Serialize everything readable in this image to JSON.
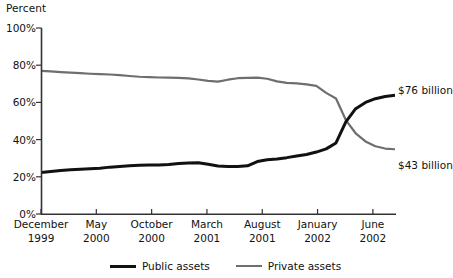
{
  "chart_data": {
    "type": "line",
    "title": "",
    "ylabel": "Percent",
    "xlabel": "",
    "ylim": [
      0,
      100
    ],
    "yticks": [
      0,
      20,
      40,
      60,
      80,
      100
    ],
    "ytick_labels": [
      "0%",
      "20%",
      "40%",
      "60%",
      "80%",
      "100%"
    ],
    "grid": false,
    "legend_position": "bottom-center",
    "x_tick_labels": [
      {
        "month": "December",
        "year": "1999",
        "index": 0
      },
      {
        "month": "May",
        "year": "2000",
        "index": 5
      },
      {
        "month": "October",
        "year": "2000",
        "index": 10
      },
      {
        "month": "March",
        "year": "2001",
        "index": 15
      },
      {
        "month": "August",
        "year": "2001",
        "index": 20
      },
      {
        "month": "January",
        "year": "2002",
        "index": 25
      },
      {
        "month": "June",
        "year": "2002",
        "index": 30
      }
    ],
    "x_index_range": [
      0,
      32
    ],
    "series": [
      {
        "name": "Public assets",
        "color": "#111111",
        "values": [
          22.3,
          22.8,
          23.4,
          23.8,
          24.1,
          24.3,
          24.6,
          25.2,
          25.6,
          25.9,
          26.2,
          26.3,
          26.3,
          26.6,
          27.1,
          27.4,
          27.6,
          26.7,
          25.8,
          25.6,
          25.5,
          25.9,
          28.2,
          29.2,
          29.6,
          30.3,
          31.2,
          32.0,
          33.3,
          35.0,
          38.2,
          49.5,
          56.6
        ]
      },
      {
        "name": "Private assets",
        "color": "#6e6e6e",
        "values": [
          77.0,
          76.7,
          76.3,
          76.0,
          75.7,
          75.4,
          75.2,
          75.0,
          74.7,
          74.2,
          73.8,
          73.6,
          73.4,
          73.3,
          73.2,
          72.9,
          72.3,
          71.6,
          71.2,
          72.2,
          73.0,
          73.2,
          73.3,
          72.7,
          71.3,
          70.5,
          70.2,
          69.7,
          68.9,
          65.1,
          62.1,
          50.5,
          43.4
        ]
      }
    ],
    "series_extended": {
      "note": "values continue to the right edge of the plot",
      "public_tail": [
        60.0,
        62.0,
        63.2,
        63.8
      ],
      "private_tail": [
        39.0,
        36.4,
        35.2,
        34.8
      ]
    },
    "annotations": [
      {
        "text": "$76 billion",
        "series": "Public assets",
        "at": "right-end"
      },
      {
        "text": "$43 billion",
        "series": "Private assets",
        "at": "right-end"
      }
    ]
  },
  "legend": {
    "items": [
      {
        "label": "Public assets",
        "color": "#111111"
      },
      {
        "label": "Private assets",
        "color": "#6e6e6e"
      }
    ]
  },
  "colors": {
    "public": "#111111",
    "private": "#6e6e6e",
    "axis": "#333333",
    "background": "#ffffff"
  }
}
